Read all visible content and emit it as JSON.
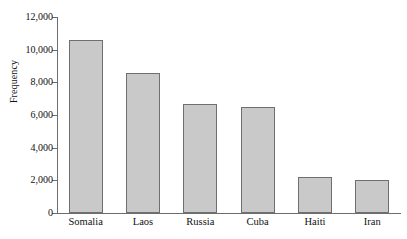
{
  "chart_data": {
    "type": "bar",
    "title": "",
    "xlabel": "",
    "ylabel": "Frequency",
    "categories": [
      "Somalia",
      "Laos",
      "Russia",
      "Cuba",
      "Haiti",
      "Iran"
    ],
    "values": [
      10600,
      8600,
      6700,
      6500,
      2200,
      2050
    ],
    "ylim": [
      0,
      12000
    ],
    "yticks": [
      0,
      2000,
      4000,
      6000,
      8000,
      10000,
      12000
    ],
    "ytick_labels": [
      "0",
      "2,000",
      "4,000",
      "6,000",
      "8,000",
      "10,000",
      "12,000"
    ],
    "grid": false,
    "legend": "none",
    "bar_fill_color": "#c9c9c9",
    "bar_border_color": "#6f6f6f",
    "axis_color": "#6d6d6d"
  }
}
